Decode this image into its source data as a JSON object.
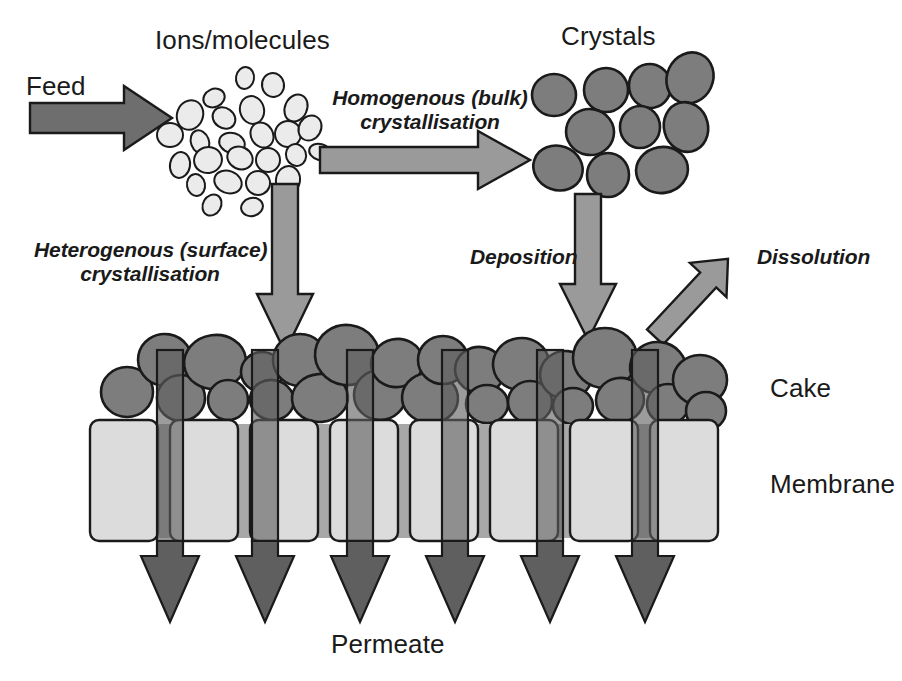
{
  "figure": {
    "background_color": "#ffffff"
  },
  "labels": {
    "feed": "Feed",
    "ions_molecules": "Ions/molecules",
    "crystals": "Crystals",
    "homogenous": "Homogenous (bulk)\ncrystallisation",
    "heterogenous": "Heterogenous (surface)\ncrystallisation",
    "deposition": "Deposition",
    "dissolution": "Dissolution",
    "cake": "Cake",
    "membrane": "Membrane",
    "permeate": "Permeate"
  },
  "colors": {
    "feed_arrow_fill": "#6e6e6e",
    "process_arrow_fill": "#9a9a9a",
    "permeate_arrow_fill": "#5f5f5f",
    "crystal_fill": "#7d7d7d",
    "ion_fill": "#ebebeb",
    "membrane_block_fill": "#dcdcdc",
    "membrane_gap_fill": "#a8a8a8",
    "outline": "#1a1a1a",
    "text": "#1a1a1a"
  },
  "elements": {
    "feed_arrow": {
      "from_x": 30,
      "to_x": 172,
      "y": 118,
      "shaft_h": 30,
      "head_w": 48,
      "head_h": 64
    },
    "homogenous_arrow": {
      "from_x": 320,
      "to_x": 530,
      "y": 160,
      "shaft_h": 26,
      "head_w": 52,
      "head_h": 58
    },
    "heterogenous_arrow": {
      "x": 285,
      "from_y": 184,
      "to_y": 352,
      "shaft_w": 26,
      "head_w": 56,
      "head_h": 58
    },
    "deposition_arrow": {
      "x": 588,
      "from_y": 194,
      "to_y": 340,
      "shaft_w": 26,
      "head_w": 56,
      "head_h": 56
    },
    "dissolution_arrow": {
      "from_x": 655,
      "from_y": 337,
      "to_x": 762,
      "to_y": 220,
      "shaft_w": 24,
      "head_w": 52,
      "head_h": 50
    },
    "cake_band": {
      "top": 338,
      "bottom": 422
    },
    "membrane_band": {
      "top": 420,
      "bottom": 541
    },
    "permeate_band": {
      "top": 350,
      "bottom": 622
    }
  },
  "ions": [
    {
      "cx": 214,
      "cy": 98,
      "rx": 11,
      "ry": 9,
      "rot": -25
    },
    {
      "cx": 245,
      "cy": 78,
      "rx": 9,
      "ry": 11,
      "rot": 10
    },
    {
      "cx": 273,
      "cy": 85,
      "rx": 11,
      "ry": 12,
      "rot": -10
    },
    {
      "cx": 190,
      "cy": 115,
      "rx": 13,
      "ry": 15,
      "rot": 20
    },
    {
      "cx": 224,
      "cy": 118,
      "rx": 12,
      "ry": 10,
      "rot": 35
    },
    {
      "cx": 252,
      "cy": 110,
      "rx": 12,
      "ry": 14,
      "rot": -15
    },
    {
      "cx": 296,
      "cy": 108,
      "rx": 11,
      "ry": 14,
      "rot": 25
    },
    {
      "cx": 170,
      "cy": 135,
      "rx": 13,
      "ry": 12,
      "rot": 0
    },
    {
      "cx": 200,
      "cy": 142,
      "rx": 9,
      "ry": 12,
      "rot": -20
    },
    {
      "cx": 232,
      "cy": 143,
      "rx": 13,
      "ry": 10,
      "rot": 15
    },
    {
      "cx": 262,
      "cy": 135,
      "rx": 11,
      "ry": 13,
      "rot": -30
    },
    {
      "cx": 288,
      "cy": 134,
      "rx": 13,
      "ry": 13,
      "rot": 0
    },
    {
      "cx": 310,
      "cy": 128,
      "rx": 11,
      "ry": 13,
      "rot": 30
    },
    {
      "cx": 180,
      "cy": 165,
      "rx": 10,
      "ry": 13,
      "rot": 10
    },
    {
      "cx": 208,
      "cy": 160,
      "rx": 14,
      "ry": 13,
      "rot": -15
    },
    {
      "cx": 240,
      "cy": 158,
      "rx": 13,
      "ry": 11,
      "rot": 25
    },
    {
      "cx": 268,
      "cy": 160,
      "rx": 12,
      "ry": 12,
      "rot": 0
    },
    {
      "cx": 296,
      "cy": 155,
      "rx": 10,
      "ry": 11,
      "rot": -20
    },
    {
      "cx": 320,
      "cy": 152,
      "rx": 11,
      "ry": 8,
      "rot": 15
    },
    {
      "cx": 196,
      "cy": 185,
      "rx": 9,
      "ry": 11,
      "rot": -10
    },
    {
      "cx": 228,
      "cy": 182,
      "rx": 14,
      "ry": 11,
      "rot": 20
    },
    {
      "cx": 258,
      "cy": 183,
      "rx": 12,
      "ry": 12,
      "rot": -25
    },
    {
      "cx": 288,
      "cy": 180,
      "rx": 12,
      "ry": 14,
      "rot": 10
    },
    {
      "cx": 212,
      "cy": 205,
      "rx": 9,
      "ry": 11,
      "rot": 30
    },
    {
      "cx": 252,
      "cy": 207,
      "rx": 11,
      "ry": 9,
      "rot": -15
    }
  ],
  "crystals": [
    {
      "cx": 554,
      "cy": 95,
      "rx": 22,
      "ry": 21,
      "rot": 0
    },
    {
      "cx": 606,
      "cy": 90,
      "rx": 22,
      "ry": 22,
      "rot": 0
    },
    {
      "cx": 650,
      "cy": 86,
      "rx": 21,
      "ry": 22,
      "rot": -10
    },
    {
      "cx": 690,
      "cy": 78,
      "rx": 23,
      "ry": 26,
      "rot": 25
    },
    {
      "cx": 590,
      "cy": 132,
      "rx": 24,
      "ry": 23,
      "rot": 10
    },
    {
      "cx": 640,
      "cy": 127,
      "rx": 20,
      "ry": 21,
      "rot": 0
    },
    {
      "cx": 686,
      "cy": 127,
      "rx": 22,
      "ry": 25,
      "rot": -15
    },
    {
      "cx": 558,
      "cy": 168,
      "rx": 25,
      "ry": 22,
      "rot": 20
    },
    {
      "cx": 608,
      "cy": 175,
      "rx": 21,
      "ry": 22,
      "rot": 0
    },
    {
      "cx": 662,
      "cy": 170,
      "rx": 26,
      "ry": 23,
      "rot": -10
    }
  ],
  "cake_particles": [
    {
      "cx": 127,
      "cy": 392,
      "rx": 26,
      "ry": 25,
      "rot": 0
    },
    {
      "cx": 165,
      "cy": 360,
      "rx": 27,
      "ry": 26,
      "rot": 10
    },
    {
      "cx": 181,
      "cy": 398,
      "rx": 24,
      "ry": 23,
      "rot": 0
    },
    {
      "cx": 215,
      "cy": 362,
      "rx": 31,
      "ry": 27,
      "rot": -8
    },
    {
      "cx": 228,
      "cy": 400,
      "rx": 20,
      "ry": 20,
      "rot": 0
    },
    {
      "cx": 262,
      "cy": 372,
      "rx": 21,
      "ry": 20,
      "rot": 0
    },
    {
      "cx": 272,
      "cy": 400,
      "rx": 22,
      "ry": 20,
      "rot": 12
    },
    {
      "cx": 300,
      "cy": 360,
      "rx": 27,
      "ry": 26,
      "rot": 0
    },
    {
      "cx": 320,
      "cy": 398,
      "rx": 28,
      "ry": 24,
      "rot": -5
    },
    {
      "cx": 347,
      "cy": 355,
      "rx": 32,
      "ry": 30,
      "rot": 8
    },
    {
      "cx": 380,
      "cy": 395,
      "rx": 26,
      "ry": 25,
      "rot": 0
    },
    {
      "cx": 397,
      "cy": 363,
      "rx": 26,
      "ry": 24,
      "rot": -12
    },
    {
      "cx": 430,
      "cy": 398,
      "rx": 28,
      "ry": 25,
      "rot": 5
    },
    {
      "cx": 443,
      "cy": 360,
      "rx": 25,
      "ry": 24,
      "rot": 0
    },
    {
      "cx": 480,
      "cy": 370,
      "rx": 25,
      "ry": 23,
      "rot": 10
    },
    {
      "cx": 487,
      "cy": 404,
      "rx": 21,
      "ry": 19,
      "rot": 0
    },
    {
      "cx": 521,
      "cy": 364,
      "rx": 28,
      "ry": 26,
      "rot": -8
    },
    {
      "cx": 530,
      "cy": 402,
      "rx": 22,
      "ry": 21,
      "rot": 0
    },
    {
      "cx": 566,
      "cy": 375,
      "rx": 26,
      "ry": 24,
      "rot": 5
    },
    {
      "cx": 573,
      "cy": 406,
      "rx": 20,
      "ry": 18,
      "rot": 0
    },
    {
      "cx": 605,
      "cy": 358,
      "rx": 32,
      "ry": 30,
      "rot": 0
    },
    {
      "cx": 620,
      "cy": 400,
      "rx": 24,
      "ry": 22,
      "rot": -10
    },
    {
      "cx": 658,
      "cy": 368,
      "rx": 28,
      "ry": 26,
      "rot": 6
    },
    {
      "cx": 668,
      "cy": 404,
      "rx": 21,
      "ry": 20,
      "rot": 0
    },
    {
      "cx": 700,
      "cy": 380,
      "rx": 27,
      "ry": 25,
      "rot": 0
    },
    {
      "cx": 706,
      "cy": 411,
      "rx": 20,
      "ry": 19,
      "rot": 0
    }
  ],
  "membrane_blocks": [
    {
      "x": 90,
      "w": 68
    },
    {
      "x": 170,
      "w": 68
    },
    {
      "x": 250,
      "w": 68
    },
    {
      "x": 330,
      "w": 68
    },
    {
      "x": 410,
      "w": 68
    },
    {
      "x": 490,
      "w": 68
    },
    {
      "x": 570,
      "w": 68
    },
    {
      "x": 650,
      "w": 68
    }
  ],
  "permeate_arrows": [
    {
      "x": 170
    },
    {
      "x": 265
    },
    {
      "x": 360
    },
    {
      "x": 455
    },
    {
      "x": 550
    },
    {
      "x": 645
    }
  ],
  "text_positions": {
    "feed": {
      "x": 26,
      "y": 72
    },
    "ions_molecules": {
      "x": 155,
      "y": 26
    },
    "crystals": {
      "x": 555,
      "y": 22
    },
    "homogenous": {
      "x": 330,
      "y": 86
    },
    "heterogenous": {
      "x": 42,
      "y": 238
    },
    "deposition": {
      "x": 478,
      "y": 243
    },
    "dissolution": {
      "x": 760,
      "y": 243
    },
    "cake": {
      "x": 768,
      "y": 374
    },
    "membrane": {
      "x": 768,
      "y": 470
    },
    "permeate": {
      "x": 333,
      "y": 633
    }
  }
}
